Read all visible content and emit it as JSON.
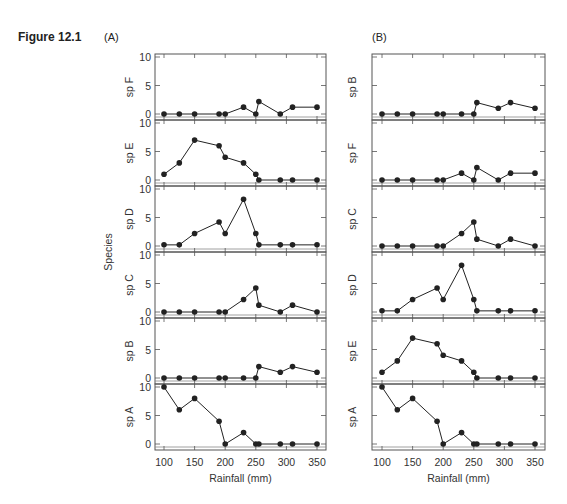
{
  "figure": {
    "title": "Figure 12.1",
    "panel_a_label": "(A)",
    "panel_b_label": "(B)",
    "shared_ylabel": "Species",
    "xlabel": "Rainfall (mm)"
  },
  "chart_data": [
    {
      "type": "line",
      "title": "(A)",
      "xlabel": "Rainfall (mm)",
      "ylabel": "Species",
      "x": [
        100,
        125,
        150,
        190,
        200,
        230,
        250,
        255,
        290,
        310,
        350
      ],
      "xticks": [
        100,
        150,
        200,
        250,
        300,
        350
      ],
      "xlim": [
        90,
        360
      ],
      "ylim": [
        0,
        10
      ],
      "yticks": [
        0,
        5,
        10
      ],
      "grid": false,
      "panels_top_to_bottom": [
        "sp F",
        "sp E",
        "sp D",
        "sp C",
        "sp B",
        "sp A"
      ],
      "series": [
        {
          "name": "sp F",
          "values": [
            0,
            0,
            0,
            0,
            0,
            1.2,
            0,
            2.2,
            0,
            1.2,
            1.2
          ]
        },
        {
          "name": "sp E",
          "values": [
            1,
            3,
            7,
            6,
            4,
            3,
            1,
            0,
            0,
            0,
            0
          ]
        },
        {
          "name": "sp D",
          "values": [
            0.2,
            0.2,
            2.2,
            4.2,
            2.2,
            8.2,
            2.2,
            0.2,
            0.2,
            0.2,
            0.2
          ]
        },
        {
          "name": "sp C",
          "values": [
            0,
            0,
            0,
            0,
            0,
            2.2,
            4.2,
            1.2,
            0,
            1.2,
            0
          ]
        },
        {
          "name": "sp B",
          "values": [
            0,
            0,
            0,
            0,
            0,
            0,
            0,
            2,
            1,
            2,
            1
          ]
        },
        {
          "name": "sp A",
          "values": [
            10,
            6,
            8,
            4,
            0,
            2,
            0,
            0,
            0,
            0,
            0
          ]
        }
      ]
    },
    {
      "type": "line",
      "title": "(B)",
      "xlabel": "Rainfall (mm)",
      "ylabel": "",
      "x": [
        100,
        125,
        150,
        190,
        200,
        230,
        250,
        255,
        290,
        310,
        350
      ],
      "xticks": [
        100,
        150,
        200,
        250,
        300,
        350
      ],
      "xlim": [
        90,
        360
      ],
      "ylim": [
        0,
        10
      ],
      "yticks": [
        0,
        5,
        10
      ],
      "grid": false,
      "panels_top_to_bottom": [
        "sp B",
        "sp F",
        "sp C",
        "sp D",
        "sp E",
        "sp A"
      ],
      "series": [
        {
          "name": "sp B",
          "values": [
            0,
            0,
            0,
            0,
            0,
            0,
            0,
            2,
            1,
            2,
            1
          ]
        },
        {
          "name": "sp F",
          "values": [
            0,
            0,
            0,
            0,
            0,
            1.2,
            0,
            2.2,
            0,
            1.2,
            1.2
          ]
        },
        {
          "name": "sp C",
          "values": [
            0,
            0,
            0,
            0,
            0,
            2.2,
            4.2,
            1.2,
            0,
            1.2,
            0
          ]
        },
        {
          "name": "sp D",
          "values": [
            0.2,
            0.2,
            2.2,
            4.2,
            2.2,
            8.2,
            2.2,
            0.2,
            0.2,
            0.2,
            0.2
          ]
        },
        {
          "name": "sp E",
          "values": [
            1,
            3,
            7,
            6,
            4,
            3,
            1,
            0,
            0,
            0,
            0
          ]
        },
        {
          "name": "sp A",
          "values": [
            10,
            6,
            8,
            4,
            0,
            2,
            0,
            0,
            0,
            0,
            0
          ]
        }
      ]
    }
  ]
}
